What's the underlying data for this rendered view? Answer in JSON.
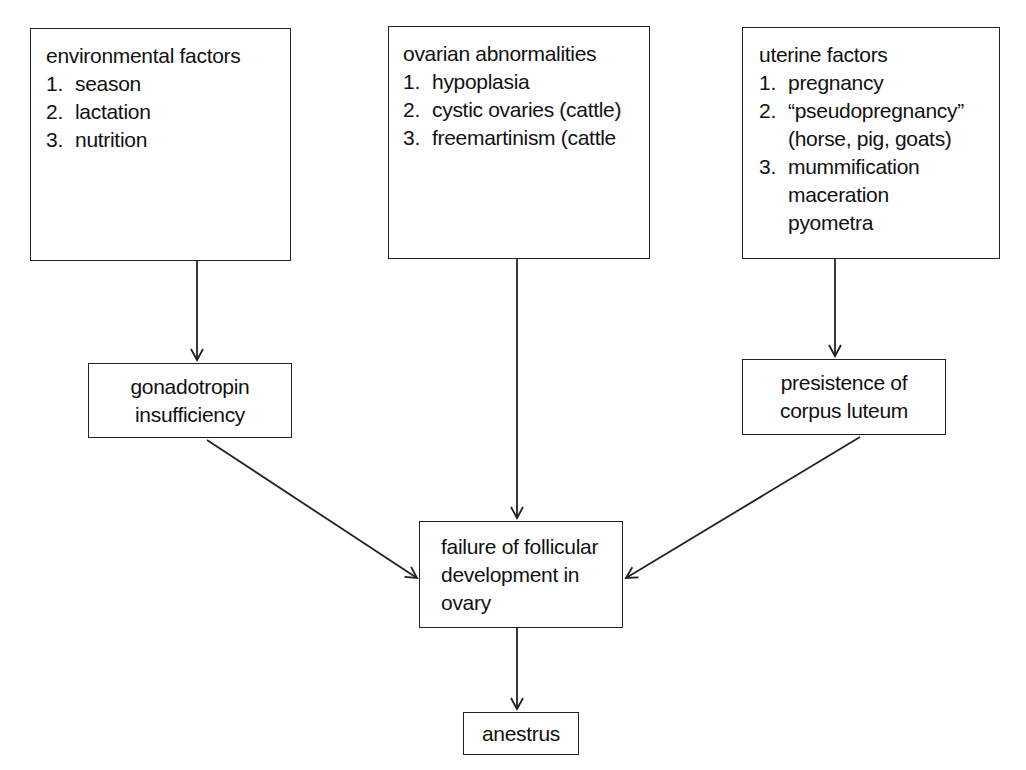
{
  "diagram": {
    "type": "flowchart",
    "nodes": {
      "environmental": {
        "title": "environmental factors",
        "items": [
          {
            "num": "1.",
            "lines": [
              "season"
            ]
          },
          {
            "num": "2.",
            "lines": [
              "lactation"
            ]
          },
          {
            "num": "3.",
            "lines": [
              "nutrition"
            ]
          }
        ]
      },
      "ovarian": {
        "title": "ovarian abnormalities",
        "items": [
          {
            "num": "1.",
            "lines": [
              "hypoplasia"
            ]
          },
          {
            "num": "2.",
            "lines": [
              "cystic ovaries (cattle)"
            ]
          },
          {
            "num": "3.",
            "lines": [
              "freemartinism (cattle"
            ]
          }
        ]
      },
      "uterine": {
        "title": "uterine factors",
        "items": [
          {
            "num": "1.",
            "lines": [
              "pregnancy"
            ]
          },
          {
            "num": "2.",
            "lines": [
              "“pseudopregnancy”",
              "(horse, pig, goats)"
            ]
          },
          {
            "num": "3.",
            "lines": [
              "mummification",
              "maceration",
              "pyometra"
            ]
          }
        ]
      },
      "gonadotropin": {
        "lines": [
          "gonadotropin",
          "insufficiency"
        ]
      },
      "corpus_luteum": {
        "lines": [
          "presistence of",
          "corpus luteum"
        ]
      },
      "failure": {
        "lines": [
          "failure of follicular",
          "development in",
          "ovary"
        ]
      },
      "anestrus": {
        "lines": [
          "anestrus"
        ]
      }
    },
    "edges": [
      {
        "from": "environmental",
        "to": "gonadotropin"
      },
      {
        "from": "ovarian",
        "to": "failure"
      },
      {
        "from": "uterine",
        "to": "corpus_luteum"
      },
      {
        "from": "gonadotropin",
        "to": "failure"
      },
      {
        "from": "corpus_luteum",
        "to": "failure"
      },
      {
        "from": "failure",
        "to": "anestrus"
      }
    ],
    "colors": {
      "line": "#222222",
      "background": "#ffffff",
      "text": "#111111"
    }
  }
}
